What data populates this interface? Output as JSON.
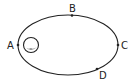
{
  "diagram": {
    "type": "elliptical-orbit",
    "labels": {
      "a": "A",
      "b": "B",
      "c": "C",
      "d": "D"
    },
    "colors": {
      "stroke": "#222222",
      "background": "#ffffff",
      "body_shade": "#888888"
    }
  }
}
